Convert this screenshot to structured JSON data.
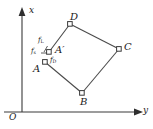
{
  "figure": {
    "type": "geometry-diagram",
    "background_color": "#ffffff",
    "stroke_color": "#3a3a3a",
    "axes": {
      "vertical_label": "x",
      "horizontal_label": "y",
      "origin_label": "O"
    },
    "points": [
      {
        "id": "A",
        "label": "A",
        "sub": "",
        "prime": ""
      },
      {
        "id": "Ap",
        "label": "A",
        "sub": "",
        "prime": "′"
      },
      {
        "id": "B",
        "label": "B",
        "sub": "",
        "prime": ""
      },
      {
        "id": "C",
        "label": "C",
        "sub": "",
        "prime": ""
      },
      {
        "id": "D",
        "label": "D",
        "sub": "",
        "prime": ""
      }
    ],
    "forces": [
      {
        "id": "fL",
        "label": "f",
        "sub": "L"
      },
      {
        "id": "fs",
        "label": "f",
        "sub": "s"
      },
      {
        "id": "fD",
        "label": "f",
        "sub": "D"
      }
    ]
  }
}
